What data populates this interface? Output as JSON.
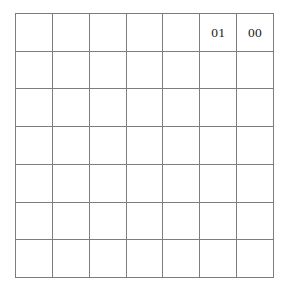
{
  "figure": {
    "name": "blank-grid-with-two-binary-labels",
    "columns": 7,
    "rows": 7,
    "grid_line_color": "#7d7d7d",
    "background_color": "#ffffff",
    "text_color": "#1c1c1c"
  },
  "cells": [
    {
      "row": 1,
      "col": 1,
      "label": ""
    },
    {
      "row": 1,
      "col": 2,
      "label": ""
    },
    {
      "row": 1,
      "col": 3,
      "label": ""
    },
    {
      "row": 1,
      "col": 4,
      "label": ""
    },
    {
      "row": 1,
      "col": 5,
      "label": ""
    },
    {
      "row": 1,
      "col": 6,
      "label": "01"
    },
    {
      "row": 1,
      "col": 7,
      "label": "00"
    },
    {
      "row": 2,
      "col": 1,
      "label": ""
    },
    {
      "row": 2,
      "col": 2,
      "label": ""
    },
    {
      "row": 2,
      "col": 3,
      "label": ""
    },
    {
      "row": 2,
      "col": 4,
      "label": ""
    },
    {
      "row": 2,
      "col": 5,
      "label": ""
    },
    {
      "row": 2,
      "col": 6,
      "label": ""
    },
    {
      "row": 2,
      "col": 7,
      "label": ""
    },
    {
      "row": 3,
      "col": 1,
      "label": ""
    },
    {
      "row": 3,
      "col": 2,
      "label": ""
    },
    {
      "row": 3,
      "col": 3,
      "label": ""
    },
    {
      "row": 3,
      "col": 4,
      "label": ""
    },
    {
      "row": 3,
      "col": 5,
      "label": ""
    },
    {
      "row": 3,
      "col": 6,
      "label": ""
    },
    {
      "row": 3,
      "col": 7,
      "label": ""
    },
    {
      "row": 4,
      "col": 1,
      "label": ""
    },
    {
      "row": 4,
      "col": 2,
      "label": ""
    },
    {
      "row": 4,
      "col": 3,
      "label": ""
    },
    {
      "row": 4,
      "col": 4,
      "label": ""
    },
    {
      "row": 4,
      "col": 5,
      "label": ""
    },
    {
      "row": 4,
      "col": 6,
      "label": ""
    },
    {
      "row": 4,
      "col": 7,
      "label": ""
    },
    {
      "row": 5,
      "col": 1,
      "label": ""
    },
    {
      "row": 5,
      "col": 2,
      "label": ""
    },
    {
      "row": 5,
      "col": 3,
      "label": ""
    },
    {
      "row": 5,
      "col": 4,
      "label": ""
    },
    {
      "row": 5,
      "col": 5,
      "label": ""
    },
    {
      "row": 5,
      "col": 6,
      "label": ""
    },
    {
      "row": 5,
      "col": 7,
      "label": ""
    },
    {
      "row": 6,
      "col": 1,
      "label": ""
    },
    {
      "row": 6,
      "col": 2,
      "label": ""
    },
    {
      "row": 6,
      "col": 3,
      "label": ""
    },
    {
      "row": 6,
      "col": 4,
      "label": ""
    },
    {
      "row": 6,
      "col": 5,
      "label": ""
    },
    {
      "row": 6,
      "col": 6,
      "label": ""
    },
    {
      "row": 6,
      "col": 7,
      "label": ""
    },
    {
      "row": 7,
      "col": 1,
      "label": ""
    },
    {
      "row": 7,
      "col": 2,
      "label": ""
    },
    {
      "row": 7,
      "col": 3,
      "label": ""
    },
    {
      "row": 7,
      "col": 4,
      "label": ""
    },
    {
      "row": 7,
      "col": 5,
      "label": ""
    },
    {
      "row": 7,
      "col": 6,
      "label": ""
    },
    {
      "row": 7,
      "col": 7,
      "label": ""
    }
  ]
}
